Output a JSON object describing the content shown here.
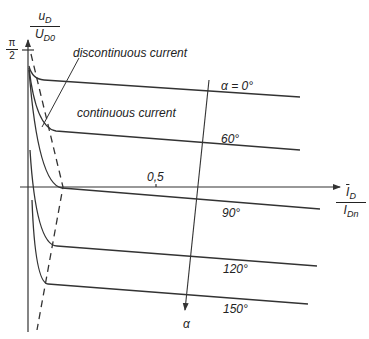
{
  "diagram": {
    "y_axis": {
      "numerator": "u",
      "numerator_sub": "D",
      "denominator": "U",
      "denominator_sub": "D0",
      "tick_label_num": "π",
      "tick_label_den": "2"
    },
    "x_axis": {
      "numerator": "I",
      "numerator_sub": "D",
      "denominator": "I",
      "denominator_sub": "Dn",
      "tick_label": "0,5"
    },
    "annotations": {
      "discontinuous": "discontinuous current",
      "continuous": "continuous current",
      "alpha_arrow": "α"
    },
    "curves": [
      {
        "label": "α = 0°"
      },
      {
        "label": "60°"
      },
      {
        "label": "90°"
      },
      {
        "label": "120°"
      },
      {
        "label": "150°"
      }
    ],
    "colors": {
      "line": "#333333",
      "text": "#222222",
      "background": "#ffffff"
    }
  }
}
